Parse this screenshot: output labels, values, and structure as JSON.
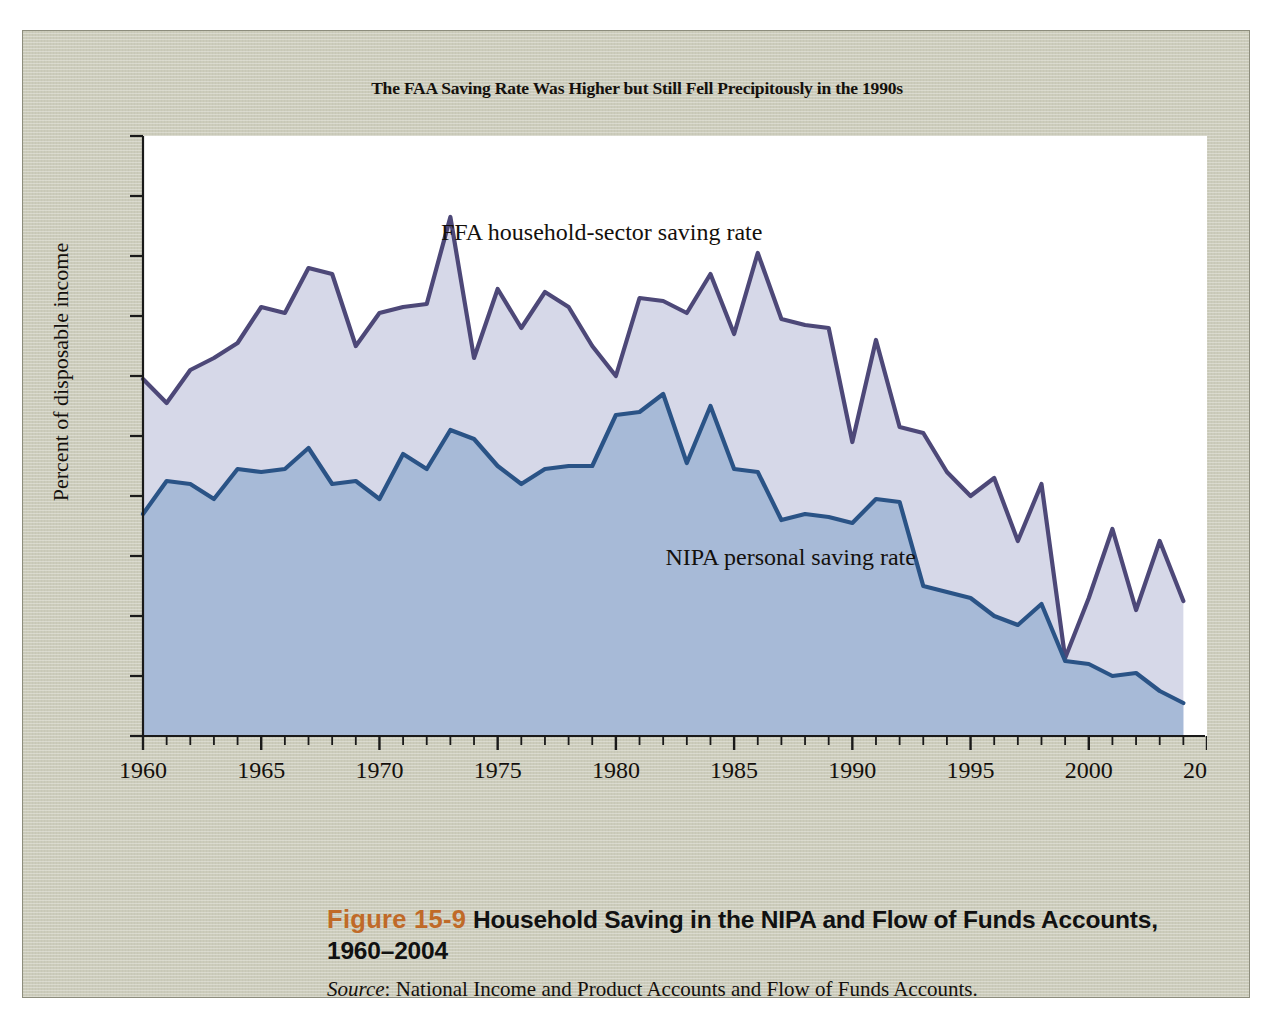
{
  "figure": {
    "panel_bg": "#ccccbb",
    "plot_bg": "#ffffff",
    "chart_title": "The FAA Saving Rate Was Higher but Still Fell Precipitously in the 1990s",
    "caption_number": "Figure 15-9",
    "caption_title": "Household Saving in the NIPA and Flow of Funds Accounts,",
    "caption_title_line2": "1960–2004",
    "source_prefix": "Source",
    "source_text": ": National Income and Product Accounts and Flow of Funds Accounts."
  },
  "chart_data": {
    "type": "area",
    "title": "The FAA Saving Rate Was Higher but Still Fell Precipitously in the 1990s",
    "xlabel": "",
    "ylabel": "Percent of disposable income",
    "xlim": [
      1960,
      2005
    ],
    "ylim": [
      0,
      20
    ],
    "ytick_step": 2,
    "xtick_step": 5,
    "xminor_step": 1,
    "grid": false,
    "legend": "inline-annotations",
    "yticks": [
      0,
      2,
      4,
      6,
      8,
      10,
      12,
      14,
      16,
      18,
      20
    ],
    "xticks": [
      1960,
      1965,
      1970,
      1975,
      1980,
      1985,
      1990,
      1995,
      2000,
      2005
    ],
    "x": [
      1960,
      1961,
      1962,
      1963,
      1964,
      1965,
      1966,
      1967,
      1968,
      1969,
      1970,
      1971,
      1972,
      1973,
      1974,
      1975,
      1976,
      1977,
      1978,
      1979,
      1980,
      1981,
      1982,
      1983,
      1984,
      1985,
      1986,
      1987,
      1988,
      1989,
      1990,
      1991,
      1992,
      1993,
      1994,
      1995,
      1996,
      1997,
      1998,
      1999,
      2000,
      2001,
      2002,
      2003,
      2004
    ],
    "series": [
      {
        "name": "FFA household-sector saving rate",
        "label": "FFA household-sector saving rate",
        "line_color": "#4d4878",
        "fill_color": "#d6d8e8",
        "values": [
          11.9,
          11.1,
          12.2,
          12.6,
          13.1,
          14.3,
          14.1,
          15.6,
          15.4,
          13.0,
          14.1,
          14.3,
          14.4,
          17.3,
          12.6,
          14.9,
          13.6,
          14.8,
          14.3,
          13.0,
          12.0,
          14.6,
          14.5,
          14.1,
          15.4,
          13.4,
          16.1,
          13.9,
          13.7,
          13.6,
          9.8,
          13.2,
          10.3,
          10.1,
          8.8,
          8.0,
          8.6,
          6.5,
          8.4,
          2.6,
          4.6,
          6.9,
          4.2,
          6.5,
          4.5
        ]
      },
      {
        "name": "NIPA personal saving rate",
        "label": "NIPA personal saving rate",
        "line_color": "#2a5386",
        "fill_color": "#a7bad7",
        "values": [
          7.4,
          8.5,
          8.4,
          7.9,
          8.9,
          8.8,
          8.9,
          9.6,
          8.4,
          8.5,
          7.9,
          9.4,
          8.9,
          10.2,
          9.9,
          9.0,
          8.4,
          8.9,
          9.0,
          9.0,
          10.7,
          10.8,
          11.4,
          9.1,
          11.0,
          8.9,
          8.8,
          7.2,
          7.4,
          7.3,
          7.1,
          7.9,
          7.8,
          5.0,
          4.8,
          4.6,
          4.0,
          3.7,
          4.4,
          2.5,
          2.4,
          2.0,
          2.1,
          1.5,
          1.1
        ]
      }
    ]
  }
}
